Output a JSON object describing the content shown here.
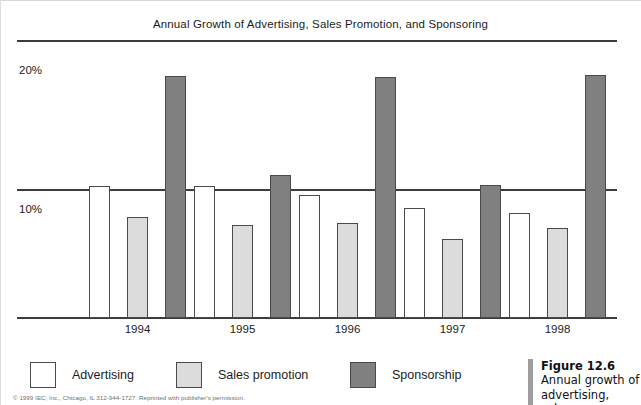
{
  "chart_data": {
    "type": "bar",
    "title": "Annual Growth of Advertising, Sales Promotion, and Sponsoring",
    "xlabel": "",
    "ylabel": "",
    "ylim": [
      0,
      21
    ],
    "yticks": [
      10,
      20
    ],
    "ytick_labels": [
      "10%",
      "20%"
    ],
    "grid": true,
    "legend_position": "bottom",
    "categories": [
      "1994",
      "1995",
      "1996",
      "1997",
      "1998"
    ],
    "series": [
      {
        "name": "Advertising",
        "color": "#ffffff",
        "values": [
          10.3,
          10.3,
          9.6,
          8.6,
          8.2
        ]
      },
      {
        "name": "Sales promotion",
        "color": "#dcdcdc",
        "values": [
          7.9,
          7.3,
          7.4,
          6.2,
          7.0
        ]
      },
      {
        "name": "Sponsorship",
        "color": "#808080",
        "values": [
          18.9,
          11.2,
          18.8,
          10.4,
          19.0
        ]
      }
    ]
  },
  "legend": {
    "items": [
      {
        "label": "Advertising"
      },
      {
        "label": "Sales promotion"
      },
      {
        "label": "Sponsorship"
      }
    ]
  },
  "source_note": "© 1999 IEC, Inc., Chicago, IL 312-944-1727. Reprinted with publisher's permission.",
  "figure_caption": {
    "number": "Figure 12.6",
    "body": "Annual growth of advertising, sales"
  }
}
